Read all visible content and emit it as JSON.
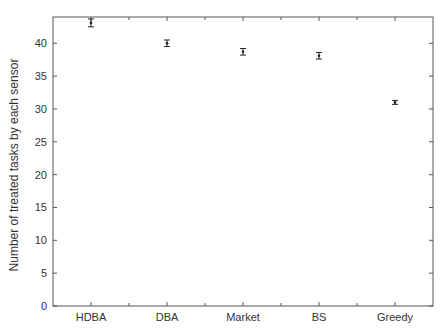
{
  "chart_data": {
    "type": "scatter",
    "subtype": "errorbar",
    "title": "",
    "xlabel": "",
    "ylabel": "Number of treated tasks by each sensor",
    "categories": [
      "HDBA",
      "DBA",
      "Market",
      "BS",
      "Greedy"
    ],
    "values": [
      43.1,
      40.0,
      38.7,
      38.1,
      31.0
    ],
    "errors": [
      0.6,
      0.5,
      0.5,
      0.5,
      0.3
    ],
    "ylim": [
      0,
      44
    ],
    "yticks": [
      0,
      5,
      10,
      15,
      20,
      25,
      30,
      35,
      40
    ],
    "xlim": [
      0.5,
      5.5
    ],
    "grid": false,
    "legend": null,
    "colors": {
      "axis": "#555555",
      "marker": "#222222",
      "text": "#333333"
    }
  }
}
